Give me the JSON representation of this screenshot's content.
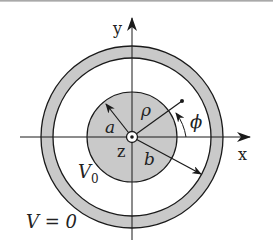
{
  "figure": {
    "colors": {
      "fill": "#c9c9c9",
      "stroke": "#1a1a1a",
      "background": "#ffffff"
    },
    "axes": {
      "x_label": "x",
      "y_label": "y",
      "z_label": "z"
    },
    "labels": {
      "inner_radius": "a",
      "outer_radius": "b",
      "rho": "ρ",
      "phi": "ϕ",
      "inner_potential_symbol": "V",
      "inner_potential_subscript": "0",
      "outer_potential": "V = 0"
    }
  }
}
